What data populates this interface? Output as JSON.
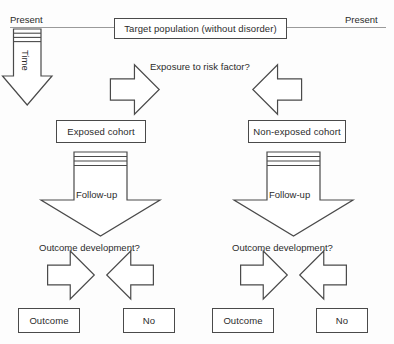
{
  "diagram": {
    "timeline": {
      "left_label": "Present",
      "right_label": "Present",
      "axis_color": "#8a8a8a"
    },
    "time_arrow": {
      "label": "Time",
      "icon": "down-block-arrow-icon"
    },
    "top_box": {
      "label": "Target population (without disorder)"
    },
    "exposure_question": {
      "label": "Exposure to risk factor?"
    },
    "branch_arrows": {
      "left_icon": "diagonal-arrow-down-left-icon",
      "right_icon": "diagonal-arrow-down-right-icon"
    },
    "cohorts": [
      {
        "label": "Exposed cohort",
        "followup": {
          "label": "Follow-up",
          "icon": "down-block-arrow-icon"
        },
        "outcome_question": "Outcome development?",
        "results": [
          {
            "label": "Outcome"
          },
          {
            "label": "No"
          }
        ]
      },
      {
        "label": "Non-exposed cohort",
        "followup": {
          "label": "Follow-up",
          "icon": "down-block-arrow-icon"
        },
        "outcome_question": "Outcome development?",
        "results": [
          {
            "label": "Outcome"
          },
          {
            "label": "No"
          }
        ]
      }
    ],
    "colors": {
      "stroke": "#4a4a4a",
      "text": "#2b2b2b",
      "background": "#fdfdfd",
      "timeline": "#8a8a8a"
    }
  }
}
